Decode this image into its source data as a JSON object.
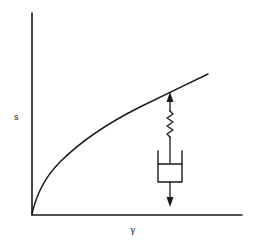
{
  "diagram": {
    "type": "stress-strain curve with viscoelastic element",
    "y_axis_label": "s",
    "x_axis_label": "γ",
    "curve_description": "concave-down rising curve from origin",
    "element": {
      "name": "spring-dashpot series (Maxwell element)",
      "components": [
        "up-arrow",
        "spring",
        "dashpot",
        "down-arrow"
      ]
    },
    "colors": {
      "ink": "#1a1a1a",
      "background": "#ffffff"
    }
  }
}
